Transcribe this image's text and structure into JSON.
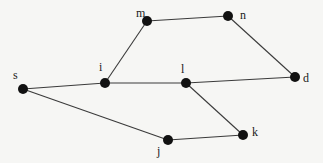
{
  "diagram": {
    "type": "undirected-graph",
    "nodes": [
      {
        "id": "s",
        "label": "s",
        "x": 23,
        "y": 89,
        "lx": 13,
        "ly": 79
      },
      {
        "id": "i",
        "label": "i",
        "x": 105,
        "y": 83,
        "lx": 99,
        "ly": 71
      },
      {
        "id": "m",
        "label": "m",
        "x": 147,
        "y": 21,
        "lx": 136,
        "ly": 17
      },
      {
        "id": "n",
        "label": "n",
        "x": 228,
        "y": 16,
        "lx": 240,
        "ly": 19
      },
      {
        "id": "l",
        "label": "l",
        "x": 186,
        "y": 83,
        "lx": 181,
        "ly": 73
      },
      {
        "id": "d",
        "label": "d",
        "x": 295,
        "y": 77,
        "lx": 303,
        "ly": 82
      },
      {
        "id": "j",
        "label": "j",
        "x": 168,
        "y": 140,
        "lx": 157,
        "ly": 155
      },
      {
        "id": "k",
        "label": "k",
        "x": 243,
        "y": 135,
        "lx": 252,
        "ly": 136
      }
    ],
    "edges": [
      [
        "s",
        "i"
      ],
      [
        "i",
        "m"
      ],
      [
        "m",
        "n"
      ],
      [
        "n",
        "d"
      ],
      [
        "i",
        "l"
      ],
      [
        "l",
        "d"
      ],
      [
        "l",
        "k"
      ],
      [
        "s",
        "j"
      ],
      [
        "j",
        "k"
      ]
    ],
    "colors": {
      "node": "#111111",
      "edge": "#3a3a3a",
      "background": "#f6f6f4"
    }
  }
}
